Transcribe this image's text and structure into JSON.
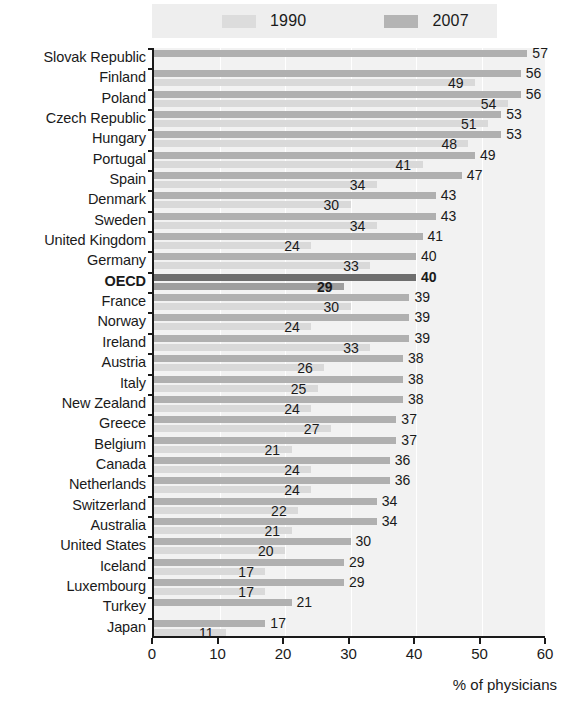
{
  "chart_data": {
    "type": "bar",
    "orientation": "horizontal",
    "title": "",
    "xlabel": "% of physicians",
    "ylabel": "",
    "xlim": [
      0,
      60
    ],
    "xticks": [
      0,
      10,
      20,
      30,
      40,
      50,
      60
    ],
    "grid": true,
    "legend_position": "top",
    "legend": [
      {
        "name": "1990",
        "color": "#d9d9d9"
      },
      {
        "name": "2007",
        "color": "#b0b0b0"
      }
    ],
    "highlight_category": "OECD",
    "highlight_color": "#6e6e6e",
    "categories": [
      "Slovak Republic",
      "Finland",
      "Poland",
      "Czech Republic",
      "Hungary",
      "Portugal",
      "Spain",
      "Denmark",
      "Sweden",
      "United Kingdom",
      "Germany",
      "OECD",
      "France",
      "Norway",
      "Ireland",
      "Austria",
      "Italy",
      "New Zealand",
      "Greece",
      "Belgium",
      "Canada",
      "Netherlands",
      "Switzerland",
      "Australia",
      "United States",
      "Iceland",
      "Luxembourg",
      "Turkey",
      "Japan"
    ],
    "series": [
      {
        "name": "1990",
        "values": [
          null,
          49,
          54,
          51,
          48,
          41,
          34,
          30,
          34,
          24,
          33,
          29,
          30,
          24,
          33,
          26,
          25,
          24,
          27,
          21,
          24,
          24,
          22,
          21,
          20,
          17,
          17,
          null,
          11
        ]
      },
      {
        "name": "2007",
        "values": [
          57,
          56,
          56,
          53,
          53,
          49,
          47,
          43,
          43,
          41,
          40,
          40,
          39,
          39,
          39,
          38,
          38,
          38,
          37,
          37,
          36,
          36,
          34,
          34,
          30,
          29,
          29,
          21,
          17
        ]
      }
    ]
  }
}
